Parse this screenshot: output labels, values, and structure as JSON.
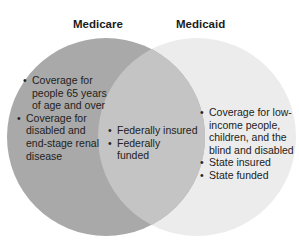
{
  "diagram": {
    "type": "venn",
    "colors": {
      "left_circle": "#a9a9a9",
      "overlap": "#c4c4c4",
      "right_circle": "#ececec",
      "background": "#ffffff"
    },
    "left": {
      "title": "Medicare",
      "items": [
        "Coverage for people 65 years of age and over",
        "Coverage for disabled and end-stage renal disease"
      ]
    },
    "overlap": {
      "items": [
        "Federally insured",
        "Federally funded"
      ]
    },
    "right": {
      "title": "Medicaid",
      "items": [
        "Coverage for low-income people, children, and the blind and disabled",
        "State insured",
        "State funded"
      ]
    }
  }
}
